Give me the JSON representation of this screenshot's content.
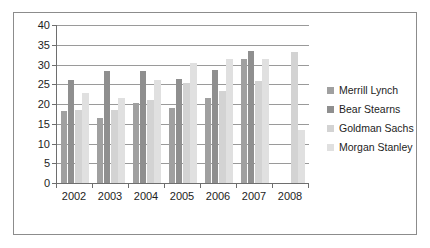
{
  "chart_data": {
    "type": "bar",
    "title": "",
    "subtitle": "",
    "xlabel": "",
    "ylabel": "",
    "categories": [
      "2002",
      "2003",
      "2004",
      "2005",
      "2006",
      "2007",
      "2008"
    ],
    "series": [
      {
        "name": "Merrill Lynch",
        "color": "#a0a0a0",
        "values": [
          18.3,
          16.5,
          20.2,
          19.1,
          21.5,
          31.5,
          null
        ]
      },
      {
        "name": "Bear Stearns",
        "color": "#8f8f8f",
        "values": [
          26.0,
          28.3,
          28.3,
          26.4,
          28.6,
          33.3,
          null
        ]
      },
      {
        "name": "Goldman Sachs",
        "color": "#d3d3d3",
        "values": [
          18.5,
          18.4,
          21.1,
          25.3,
          23.2,
          25.8,
          33.1
        ]
      },
      {
        "name": "Morgan Stanley",
        "color": "#e0e0e0",
        "values": [
          22.8,
          21.5,
          26.2,
          30.4,
          31.3,
          31.3,
          13.3
        ]
      }
    ],
    "ylim": [
      0,
      40
    ],
    "y_ticks": [
      0,
      5,
      10,
      15,
      20,
      25,
      30,
      35,
      40
    ],
    "y_tick_labels": [
      "0",
      "5",
      "10",
      "15",
      "20",
      "25",
      "30",
      "35",
      "40"
    ],
    "grid": true,
    "grid_axis": "y",
    "legend_position": "right",
    "legend_entries": [
      "Merrill Lynch",
      "Bear Stearns",
      "Goldman Sachs",
      "Morgan Stanley"
    ],
    "border_color": "#8c8c8c",
    "axis_color": "#6e6e6e",
    "grid_color": "#9a9a9a",
    "background": "#ffffff"
  }
}
